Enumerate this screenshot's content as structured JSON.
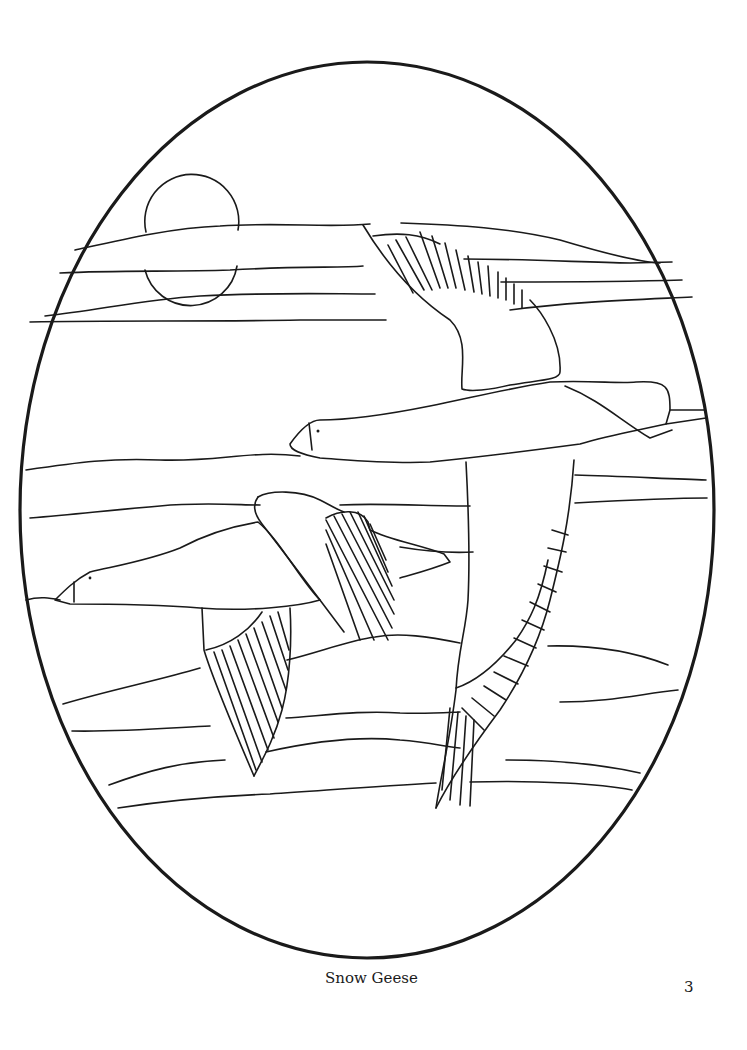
{
  "page": {
    "caption": "Snow Geese",
    "page_number": "3"
  },
  "illustration": {
    "subject": "Two snow geese flying over horizontal bands of sky with a sun, enclosed in an oval frame",
    "style": "black line art coloring page",
    "line_color": "#1a1a1a",
    "background_color": "#ffffff"
  }
}
